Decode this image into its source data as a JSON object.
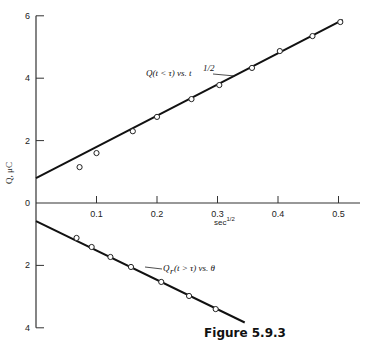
{
  "chart_data": {
    "type": "line",
    "title": "Figure 5.9.3",
    "xlabel": "sec^1/2",
    "ylabel": "Q, μC",
    "xlim": [
      0,
      0.55
    ],
    "ylim_upper": [
      0,
      6
    ],
    "ylim_lower": [
      0,
      4
    ],
    "x_ticks": [
      0.1,
      0.2,
      0.3,
      0.4,
      0.5
    ],
    "x_tick_labels": [
      "0.1",
      "0.2",
      "0.3",
      "0.4",
      "0.5"
    ],
    "y_ticks_upper": [
      0,
      2,
      4,
      6
    ],
    "y_tick_labels_upper": [
      "0",
      "2",
      "4",
      "6"
    ],
    "y_ticks_lower": [
      2,
      4
    ],
    "y_tick_labels_lower": [
      "2",
      "4"
    ],
    "grid": false,
    "legend": "none (inline annotations)",
    "series": [
      {
        "name": "Q(t < τ) vs. t^1/2",
        "annotation": "Q(t < τ) vs. t^1/2",
        "points_x": [
          0.072,
          0.1,
          0.16,
          0.2,
          0.257,
          0.303,
          0.357,
          0.403,
          0.457,
          0.503
        ],
        "points_y": [
          1.15,
          1.6,
          2.3,
          2.76,
          3.33,
          3.78,
          4.33,
          4.87,
          5.35,
          5.8
        ],
        "fit_line": {
          "x": [
            0,
            0.507
          ],
          "y": [
            0.8,
            5.87
          ]
        }
      },
      {
        "name": "Qr(t > τ) vs. θ",
        "annotation": "Qr(t > τ) vs. θ",
        "plotted_below_axis": true,
        "points_x": [
          0.067,
          0.092,
          0.123,
          0.157,
          0.207,
          0.253,
          0.297
        ],
        "points_y": [
          1.12,
          1.41,
          1.73,
          2.05,
          2.53,
          2.98,
          3.4
        ],
        "fit_line": {
          "x": [
            0,
            0.345
          ],
          "y": [
            0.58,
            3.83
          ]
        }
      }
    ]
  },
  "labels": {
    "caption": "Figure 5.9.3",
    "xlabel": "sec",
    "xlabel_sup": "1/2",
    "ylabel": "Q, μC",
    "ann_upper": "Q(t < τ) vs. t",
    "ann_upper_sup": "1/2",
    "ann_lower_Q": "Q",
    "ann_lower_sub": "r",
    "ann_lower_rest": "(t > τ) vs. θ"
  }
}
